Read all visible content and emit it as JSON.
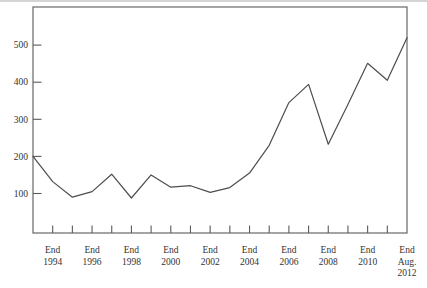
{
  "figure": {
    "background": "#ffffff",
    "axis_color": "#5a5a5a",
    "line_color": "#4d4d4d",
    "text_color": "#333333",
    "scan_edge_color": "#d4d4d4"
  },
  "chart_data": {
    "type": "line",
    "title": "",
    "xlabel": "",
    "ylabel": "",
    "x_range_years": [
      1993,
      2012
    ],
    "ylim": [
      0,
      610
    ],
    "grid": false,
    "legend": "none",
    "plot_box": true,
    "y_ticks": [
      100,
      200,
      300,
      400,
      500
    ],
    "x_minor_tick_years": [
      1994,
      1995,
      1996,
      1997,
      1998,
      1999,
      2000,
      2001,
      2002,
      2003,
      2004,
      2005,
      2006,
      2007,
      2008,
      2009,
      2010,
      2011
    ],
    "x_labels": [
      {
        "year": 1994,
        "lines": [
          "End",
          "1994"
        ]
      },
      {
        "year": 1996,
        "lines": [
          "End",
          "1996"
        ]
      },
      {
        "year": 1998,
        "lines": [
          "End",
          "1998"
        ]
      },
      {
        "year": 2000,
        "lines": [
          "End",
          "2000"
        ]
      },
      {
        "year": 2002,
        "lines": [
          "End",
          "2002"
        ]
      },
      {
        "year": 2004,
        "lines": [
          "End",
          "2004"
        ]
      },
      {
        "year": 2006,
        "lines": [
          "End",
          "2006"
        ]
      },
      {
        "year": 2008,
        "lines": [
          "End",
          "2008"
        ]
      },
      {
        "year": 2010,
        "lines": [
          "End",
          "2010"
        ]
      },
      {
        "year": 2012,
        "lines": [
          "End",
          "Aug.",
          "2012"
        ]
      }
    ],
    "series": [
      {
        "name": "series-1",
        "points": [
          {
            "year": 1993,
            "value": 200
          },
          {
            "year": 1994,
            "value": 132
          },
          {
            "year": 1995,
            "value": 90
          },
          {
            "year": 1996,
            "value": 105
          },
          {
            "year": 1997,
            "value": 152
          },
          {
            "year": 1998,
            "value": 88
          },
          {
            "year": 1999,
            "value": 150
          },
          {
            "year": 2000,
            "value": 117
          },
          {
            "year": 2001,
            "value": 121
          },
          {
            "year": 2002,
            "value": 103
          },
          {
            "year": 2003,
            "value": 116
          },
          {
            "year": 2004,
            "value": 155
          },
          {
            "year": 2005,
            "value": 230
          },
          {
            "year": 2006,
            "value": 345
          },
          {
            "year": 2007,
            "value": 394
          },
          {
            "year": 2008,
            "value": 233
          },
          {
            "year": 2009,
            "value": 340
          },
          {
            "year": 2010,
            "value": 451
          },
          {
            "year": 2011,
            "value": 405
          },
          {
            "year": 2012,
            "value": 520,
            "x_label": "End Aug. 2012"
          }
        ]
      }
    ]
  }
}
